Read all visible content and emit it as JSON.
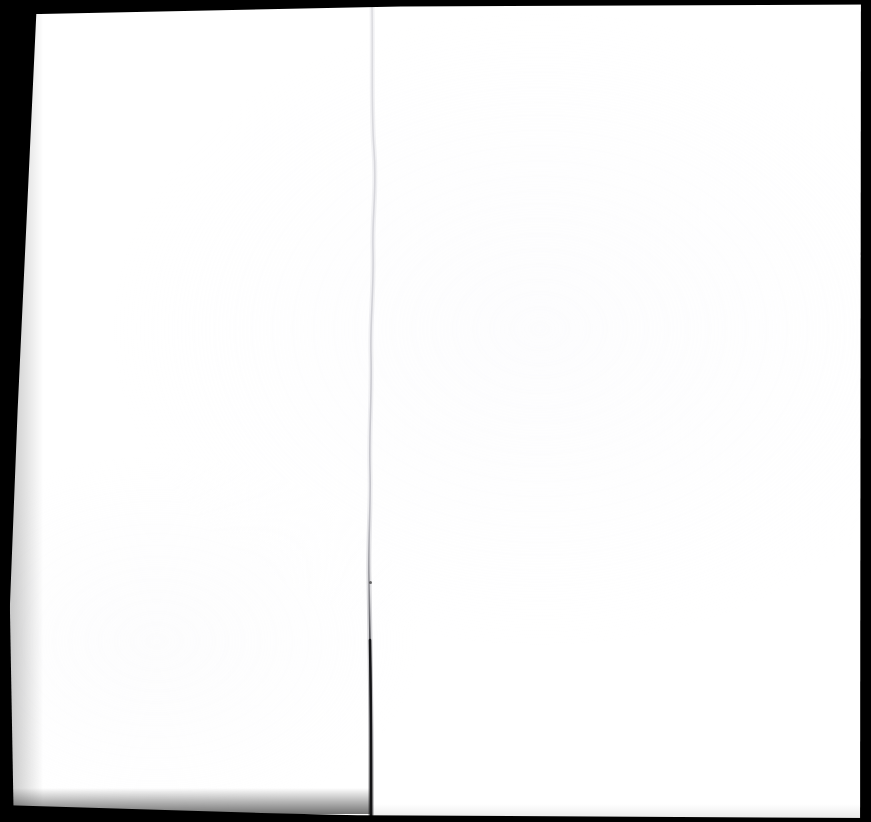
{
  "document": {
    "kind": "scanned-page-image",
    "content_text": "",
    "page_state": "blank",
    "spread": "two-page",
    "width_px": 871,
    "height_px": 822
  },
  "colors": {
    "paper": "#ffffff",
    "scanner_background": "#000000",
    "crease_light": "#f2f2f4",
    "crease_dark": "#1a1a1a",
    "speck": "#3c3c3c"
  },
  "regions": {
    "left_page": {
      "name": "left-page-leaf",
      "x": 0,
      "y": 0,
      "width": 371,
      "height": 822
    },
    "right_page": {
      "name": "right-page-leaf",
      "x": 371,
      "y": 0,
      "width": 500,
      "height": 822
    }
  },
  "artifacts": {
    "gutter_fold": {
      "name": "center-fold-crease",
      "top_x": 372,
      "bottom_x": 371,
      "visible": true,
      "darkens_below_y": 600
    },
    "speck": {
      "name": "scan-speck",
      "x": 370,
      "y": 582,
      "size_px": 3
    },
    "edges": {
      "left_wedge_top_width": 37,
      "left_wedge_bottom_width": 4,
      "top_strip_height": 8,
      "right_strip_x": 858,
      "bottom_strip_y": 812
    }
  }
}
